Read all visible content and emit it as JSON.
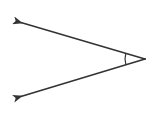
{
  "diagram": {
    "type": "angle",
    "colors": {
      "background": "#ffffff",
      "stroke": "#333333"
    },
    "vertex": {
      "x": 145,
      "y": 59
    },
    "rays": [
      {
        "name": "upper-ray",
        "from": {
          "x": 145,
          "y": 59
        },
        "to": {
          "x": 19,
          "y": 22
        },
        "arrowhead": true
      },
      {
        "name": "lower-ray",
        "from": {
          "x": 145,
          "y": 59
        },
        "to": {
          "x": 19,
          "y": 97
        },
        "arrowhead": true
      }
    ],
    "angle_arc": {
      "center": {
        "x": 145,
        "y": 59
      },
      "radius": 20
    }
  }
}
